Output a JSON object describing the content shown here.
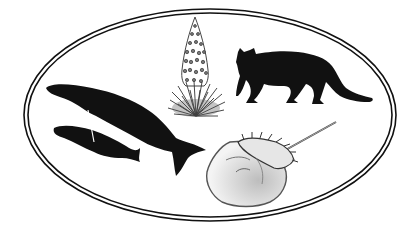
{
  "illustration": {
    "subjects": [
      {
        "id": "humpback-whale",
        "label": "humpback whale with calf"
      },
      {
        "id": "silversword",
        "label": "silversword plant"
      },
      {
        "id": "cougar",
        "label": "cougar"
      },
      {
        "id": "horseshoe-crab",
        "label": "horseshoe crab"
      }
    ],
    "border": {
      "style": "double oval"
    }
  },
  "colors": {
    "background": "#ffffff",
    "ink": "#111111",
    "plant_gray": "#555555",
    "crab_shade": "#bdbdbd",
    "crab_light": "#f2f2f2"
  }
}
